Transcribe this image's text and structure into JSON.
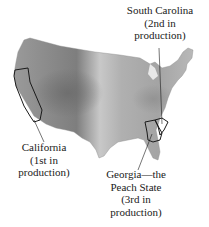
{
  "figure": {
    "colors": {
      "background": "#ffffff",
      "land_light": "#d4d4d4",
      "land_mid": "#a9a9a9",
      "land_dark": "#7a7a7a",
      "outline": "#222222",
      "text": "#1a1a1a"
    }
  },
  "labels": {
    "south_carolina": {
      "lines": [
        "South Carolina",
        "(2nd in",
        "production)"
      ]
    },
    "california": {
      "lines": [
        "California",
        "(1st in",
        "production)"
      ]
    },
    "georgia": {
      "lines": [
        "Georgia—the",
        "Peach State",
        "(3rd in",
        "production)"
      ]
    }
  },
  "highlighted_states": [
    {
      "name": "California",
      "rank": 1
    },
    {
      "name": "South Carolina",
      "rank": 2
    },
    {
      "name": "Georgia",
      "rank": 3
    }
  ]
}
